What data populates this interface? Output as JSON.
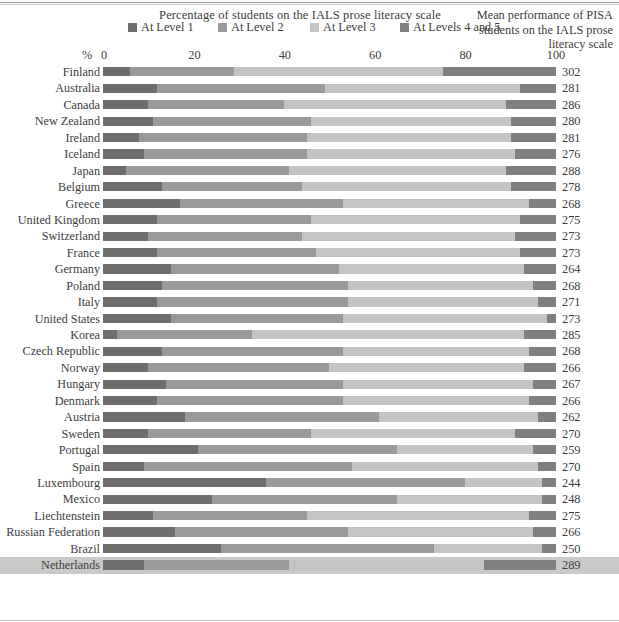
{
  "header": {
    "title": "Percentage of students on the IALS prose literacy scale",
    "right_caption": "Mean performance of PISA students on the IALS prose literacy scale"
  },
  "legend": {
    "items": [
      {
        "label": "At Level 1",
        "color": "#6e6e6e"
      },
      {
        "label": "At Level 2",
        "color": "#9a9a9a"
      },
      {
        "label": "At Level 3",
        "color": "#c4c4c4"
      },
      {
        "label": "At Levels 4 and 5",
        "color": "#808080"
      }
    ]
  },
  "axis": {
    "unit_label": "%",
    "ticks": [
      "0",
      "20",
      "40",
      "60",
      "80",
      "100"
    ]
  },
  "chart_data": {
    "type": "bar",
    "title": "Percentage of students on the IALS prose literacy scale",
    "xlabel": "%",
    "ylabel": "",
    "xlim": [
      0,
      100
    ],
    "grid": false,
    "legend_position": "top",
    "stacked": true,
    "categories": [
      "Finland",
      "Australia",
      "Canada",
      "New Zealand",
      "Ireland",
      "Iceland",
      "Japan",
      "Belgium",
      "Greece",
      "United Kingdom",
      "Switzerland",
      "France",
      "Germany",
      "Poland",
      "Italy",
      "United States",
      "Korea",
      "Czech Republic",
      "Norway",
      "Hungary",
      "Denmark",
      "Austria",
      "Sweden",
      "Portugal",
      "Spain",
      "Luxembourg",
      "Mexico",
      "Liechtenstein",
      "Russian Federation",
      "Brazil",
      "Netherlands"
    ],
    "series": [
      {
        "name": "At Level 1",
        "color": "#6e6e6e",
        "values": [
          6,
          12,
          10,
          11,
          8,
          9,
          5,
          13,
          17,
          12,
          10,
          12,
          15,
          13,
          12,
          15,
          3,
          13,
          10,
          14,
          12,
          18,
          10,
          21,
          9,
          36,
          24,
          11,
          16,
          26,
          9
        ]
      },
      {
        "name": "At Level 2",
        "color": "#9a9a9a",
        "values": [
          23,
          37,
          30,
          35,
          37,
          36,
          36,
          31,
          36,
          34,
          34,
          35,
          37,
          41,
          42,
          38,
          30,
          40,
          40,
          39,
          41,
          43,
          36,
          44,
          46,
          44,
          41,
          34,
          38,
          47,
          32
        ]
      },
      {
        "name": "At Level 3",
        "color": "#c4c4c4",
        "values": [
          46,
          43,
          49,
          44,
          45,
          46,
          48,
          46,
          41,
          46,
          47,
          45,
          41,
          41,
          42,
          45,
          60,
          41,
          43,
          42,
          41,
          35,
          45,
          30,
          41,
          17,
          32,
          49,
          41,
          24,
          43
        ]
      },
      {
        "name": "At Levels 4 and 5",
        "color": "#808080",
        "values": [
          25,
          8,
          11,
          10,
          10,
          9,
          11,
          10,
          6,
          8,
          9,
          8,
          7,
          5,
          4,
          2,
          7,
          6,
          7,
          5,
          6,
          4,
          9,
          5,
          4,
          3,
          3,
          6,
          5,
          3,
          16
        ]
      }
    ],
    "mean_scores": [
      302,
      281,
      286,
      280,
      281,
      276,
      288,
      278,
      268,
      275,
      273,
      273,
      264,
      268,
      271,
      273,
      285,
      268,
      266,
      267,
      266,
      262,
      270,
      259,
      270,
      244,
      248,
      275,
      266,
      250,
      289
    ],
    "highlighted_category": "Netherlands"
  }
}
